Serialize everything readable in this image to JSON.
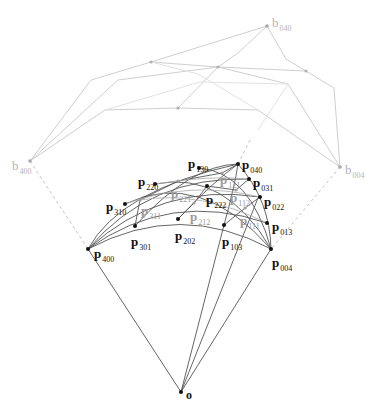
{
  "figure": {
    "colors": {
      "control_net": "#c8c8c8",
      "surface_curves": "#555555",
      "inner_curves": "#9a9a9a",
      "points": "#111111",
      "light_points": "#a0a0a0"
    }
  },
  "control_points": [
    {
      "id": "b040",
      "label": "b",
      "sub": "040",
      "x": 267,
      "y": 26,
      "lx": 272,
      "ly": 14
    },
    {
      "id": "b004",
      "label": "b",
      "sub": "004",
      "x": 340,
      "y": 167,
      "lx": 345,
      "ly": 161
    },
    {
      "id": "b400",
      "label": "b",
      "sub": "400",
      "x": 30,
      "y": 161,
      "lx": 12,
      "ly": 157
    }
  ],
  "control_net_interior": [
    {
      "x": 151,
      "y": 62
    },
    {
      "x": 218,
      "y": 67
    },
    {
      "x": 306,
      "y": 71
    },
    {
      "x": 178,
      "y": 108
    }
  ],
  "surface_points": [
    {
      "id": "p400",
      "sub": "400",
      "x": 88,
      "y": 249,
      "lx": 94,
      "ly": 245,
      "style": "black"
    },
    {
      "id": "p004",
      "sub": "004",
      "x": 271,
      "y": 249,
      "lx": 272,
      "ly": 254,
      "style": "black"
    },
    {
      "id": "p040",
      "sub": "040",
      "x": 238,
      "y": 164,
      "lx": 242,
      "ly": 156,
      "style": "black"
    },
    {
      "id": "p130",
      "sub": "130",
      "x": 199,
      "y": 168,
      "lx": 188,
      "ly": 155,
      "style": "black"
    },
    {
      "id": "p220",
      "sub": "220",
      "x": 155,
      "y": 184,
      "lx": 138,
      "ly": 173,
      "style": "black"
    },
    {
      "id": "p310",
      "sub": "310",
      "x": 125,
      "y": 204,
      "lx": 106,
      "ly": 198,
      "style": "black"
    },
    {
      "id": "p031",
      "sub": "031",
      "x": 249,
      "y": 179,
      "lx": 253,
      "ly": 174,
      "style": "black"
    },
    {
      "id": "p022",
      "sub": "022",
      "x": 260,
      "y": 197,
      "lx": 264,
      "ly": 193,
      "style": "black"
    },
    {
      "id": "p013",
      "sub": "013",
      "x": 267,
      "y": 223,
      "lx": 272,
      "ly": 218,
      "style": "black"
    },
    {
      "id": "p301",
      "sub": "301",
      "x": 135,
      "y": 226,
      "lx": 131,
      "ly": 233,
      "style": "black"
    },
    {
      "id": "p202",
      "sub": "202",
      "x": 178,
      "y": 219,
      "lx": 175,
      "ly": 227,
      "style": "black"
    },
    {
      "id": "p103",
      "sub": "103",
      "x": 224,
      "y": 225,
      "lx": 222,
      "ly": 233,
      "style": "black"
    },
    {
      "id": "p222",
      "sub": "222",
      "x": 207,
      "y": 186,
      "lx": 206,
      "ly": 191,
      "style": "black"
    },
    {
      "id": "p121",
      "sub": "121",
      "x": 222,
      "y": 173,
      "lx": 220,
      "ly": 171,
      "style": "light"
    },
    {
      "id": "p221",
      "sub": "221",
      "x": 178,
      "y": 181,
      "lx": 171,
      "ly": 185,
      "style": "light"
    },
    {
      "id": "p311",
      "sub": "311",
      "x": 140,
      "y": 200,
      "lx": 141,
      "ly": 202,
      "style": "light"
    },
    {
      "id": "p212",
      "sub": "212",
      "x": 194,
      "y": 203,
      "lx": 190,
      "ly": 208,
      "style": "light"
    },
    {
      "id": "p112",
      "sub": "112",
      "x": 236,
      "y": 190,
      "lx": 230,
      "ly": 189,
      "style": "light"
    },
    {
      "id": "p111",
      "sub": "111",
      "x": 245,
      "y": 208,
      "lx": 240,
      "ly": 212,
      "style": "light"
    }
  ],
  "surface_label_base": "p",
  "origin": {
    "label": "o",
    "x": 181,
    "y": 392,
    "lx": 186,
    "ly": 386
  }
}
